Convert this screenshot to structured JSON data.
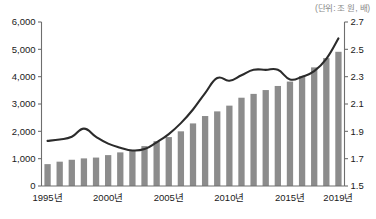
{
  "unit_note": "(단위: 조 원, 배)",
  "chart_data": {
    "type": "bar",
    "title": "",
    "subtitle": "",
    "xlabel": "",
    "ylabel": "",
    "grid": false,
    "legend_position": "none",
    "annotations": [
      "(단위: 조 원, 배)"
    ],
    "x": [
      1995,
      1996,
      1997,
      1998,
      1999,
      2000,
      2001,
      2002,
      2003,
      2004,
      2005,
      2006,
      2007,
      2008,
      2009,
      2010,
      2011,
      2012,
      2013,
      2014,
      2015,
      2016,
      2017,
      2018,
      2019
    ],
    "categories": [
      "1995",
      "1996",
      "1997",
      "1998",
      "1999",
      "2000",
      "2001",
      "2002",
      "2003",
      "2004",
      "2005",
      "2006",
      "2007",
      "2008",
      "2009",
      "2010",
      "2011",
      "2012",
      "2013",
      "2014",
      "2015",
      "2016",
      "2017",
      "2018",
      "2019"
    ],
    "x_tick_labels": [
      "1995년",
      "2000년",
      "2005년",
      "2010년",
      "2015년",
      "2019년"
    ],
    "x_tick_values": [
      1995,
      2000,
      2005,
      2010,
      2015,
      2019
    ],
    "left_axis": {
      "ylim": [
        0,
        6000
      ],
      "ticks": [
        0,
        1000,
        2000,
        3000,
        4000,
        5000,
        6000
      ],
      "tick_labels": [
        "0",
        "1,000",
        "2,000",
        "3,000",
        "4,000",
        "5,000",
        "6,000"
      ],
      "unit": "조 원"
    },
    "right_axis": {
      "ylim": [
        1.5,
        2.7
      ],
      "ticks": [
        1.5,
        1.7,
        1.9,
        2.1,
        2.3,
        2.5,
        2.7
      ],
      "tick_labels": [
        "1.5",
        "1.7",
        "1.9",
        "2.1",
        "2.3",
        "2.5",
        "2.7"
      ],
      "unit": "배"
    },
    "series": [
      {
        "name": "금액",
        "type": "bar",
        "axis": "left",
        "color": "#8c8c8c",
        "values": [
          800,
          890,
          960,
          1010,
          1040,
          1130,
          1230,
          1300,
          1460,
          1640,
          1790,
          2000,
          2290,
          2560,
          2730,
          2940,
          3230,
          3370,
          3510,
          3660,
          3820,
          4020,
          4340,
          4680,
          4910
        ]
      },
      {
        "name": "배율",
        "type": "line",
        "axis": "right",
        "color": "#2b2b2b",
        "values": [
          1.83,
          1.84,
          1.86,
          1.92,
          1.86,
          1.81,
          1.78,
          1.76,
          1.77,
          1.82,
          1.88,
          1.96,
          2.06,
          2.18,
          2.29,
          2.27,
          2.31,
          2.35,
          2.35,
          2.35,
          2.28,
          2.3,
          2.34,
          2.43,
          2.58
        ]
      }
    ]
  }
}
